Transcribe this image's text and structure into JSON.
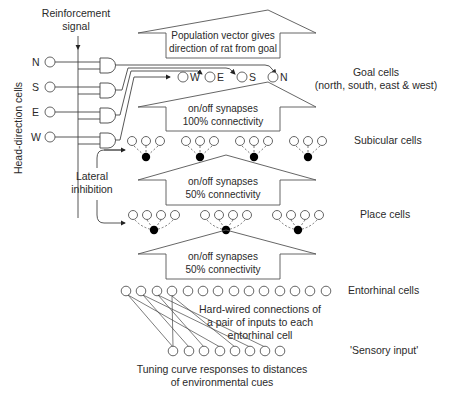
{
  "labels": {
    "reinforcement_1": "Reinforcement",
    "reinforcement_2": "signal",
    "head_direction": "Head-direction cells",
    "lateral_1": "Lateral",
    "lateral_2": "inhibition",
    "goal_cells": "Goal cells",
    "goal_cells_sub": "(north, south, east & west)",
    "subicular": "Subicular cells",
    "place": "Place cells",
    "entorhinal": "Entorhinal cells",
    "sensory": "'Sensory input'"
  },
  "head_direction_cells": [
    "N",
    "S",
    "E",
    "W"
  ],
  "goal_cells": [
    "W",
    "E",
    "S",
    "N"
  ],
  "arrows": {
    "top_1": "Population vector gives",
    "top_2": "direction of rat from goal",
    "goal_sub_1": "on/off synapses",
    "goal_sub_2": "100% connectivity",
    "sub_place_1": "on/off synapses",
    "sub_place_2": "50% connectivity",
    "place_ent_1": "on/off synapses",
    "place_ent_2": "50% connectivity"
  },
  "annotations": {
    "hardwired_1": "Hard-wired connections of",
    "hardwired_2": "a pair of inputs to each",
    "hardwired_3": "entorhinal cell",
    "tuning_1": "Tuning curve responses to distances",
    "tuning_2": "of environmental cues"
  }
}
